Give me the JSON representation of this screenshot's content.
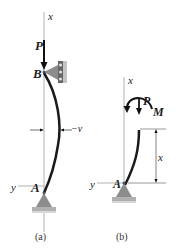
{
  "figures": [
    {
      "caption": "(a)",
      "labels": {
        "axis_x": "x",
        "axis_y": "y",
        "load": "P",
        "top_support": "B",
        "bottom_support": "A",
        "deflection": "−v"
      }
    },
    {
      "caption": "(b)",
      "labels": {
        "axis_x": "x",
        "axis_y": "y",
        "load": "P",
        "moment": "M",
        "bottom_support": "A",
        "dimension": "x"
      }
    }
  ],
  "colors": {
    "column": "#1a1a1a",
    "axis": "#999999",
    "support_fill": "#8c8c8c",
    "ground": "#b0b0b0"
  }
}
